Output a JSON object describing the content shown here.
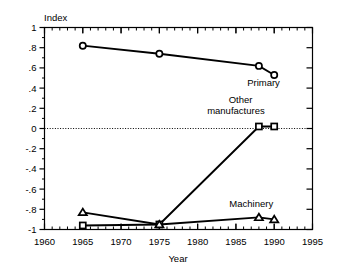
{
  "chart_data": {
    "type": "line",
    "title": "",
    "xlabel": "Year",
    "ylabel": "Index",
    "xlim": [
      1960,
      1995
    ],
    "ylim": [
      -1,
      1
    ],
    "grid": false,
    "legend_position": "inline-annotations",
    "zero_reference_line": true,
    "x": [
      1965,
      1975,
      1988,
      1990
    ],
    "xticks": [
      1960,
      1965,
      1970,
      1975,
      1980,
      1985,
      1990,
      1995
    ],
    "xtick_labels": [
      "1960",
      "1965",
      "1970",
      "1975",
      "1980",
      "1985",
      "1990",
      "1995"
    ],
    "yticks": [
      1,
      0.8,
      0.6,
      0.4,
      0.2,
      0,
      -0.2,
      -0.4,
      -0.6,
      -0.8,
      -1
    ],
    "ytick_labels": [
      "1",
      ".8",
      ".6",
      ".4",
      ".2",
      "0",
      "-.2",
      "-.4",
      "-.6",
      "-.8",
      "-1"
    ],
    "series": [
      {
        "name": "Primary",
        "marker": "circle",
        "values": [
          0.82,
          0.74,
          0.62,
          0.53
        ]
      },
      {
        "name": "Other manufactures",
        "marker": "square",
        "values": [
          -0.96,
          -0.95,
          0.02,
          0.02
        ]
      },
      {
        "name": "Machinery",
        "marker": "triangle",
        "values": [
          -0.83,
          -0.95,
          -0.88,
          -0.9
        ]
      }
    ],
    "annotations": [
      {
        "text": "Primary",
        "x": 1988.6,
        "y": 0.42
      },
      {
        "text": "Other",
        "x": 1985.6,
        "y": 0.25
      },
      {
        "text": "manufactures",
        "x": 1985.0,
        "y": 0.145
      },
      {
        "text": "Machinery",
        "x": 1987.0,
        "y": -0.78
      }
    ],
    "colors": {
      "line": "#000000",
      "marker_fill": "#ffffff",
      "axis": "#000000",
      "background": "#ffffff"
    }
  }
}
